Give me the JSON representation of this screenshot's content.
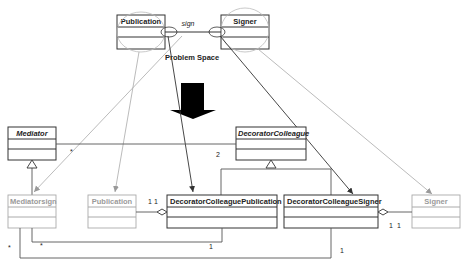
{
  "diagram": {
    "type": "uml-class-diagram",
    "problem_space": {
      "label": "Problem Space",
      "association_label": "sign",
      "classes": [
        {
          "id": "publication_top",
          "name": "Publication"
        },
        {
          "id": "signer_top",
          "name": "Signer"
        }
      ]
    },
    "solution_space": {
      "classes": [
        {
          "id": "mediator",
          "name": "Mediator",
          "abstract": true
        },
        {
          "id": "decorator_colleague",
          "name": "DecoratorColleague",
          "abstract": true
        },
        {
          "id": "mediatorsign",
          "name": "Mediatorsign",
          "faded": true
        },
        {
          "id": "publication_bottom",
          "name": "Publication",
          "faded": true
        },
        {
          "id": "dc_publication",
          "name": "DecoratorColleaguePublication"
        },
        {
          "id": "dc_signer",
          "name": "DecoratorColleagueSigner"
        },
        {
          "id": "signer_bottom",
          "name": "Signer",
          "faded": true
        }
      ],
      "multiplicities": {
        "mediator_assoc_star": "*",
        "mediator_assoc_two": "2",
        "pub_agg_left": "1",
        "pub_agg_right": "1",
        "signer_agg_left": "1",
        "signer_agg_right": "1",
        "inner_loop_star": "*",
        "inner_loop_one": "1",
        "outer_loop_star": "*",
        "outer_loop_one": "1"
      }
    },
    "transform_arrow": "down-arrow",
    "colors": {
      "line_dark": "#333333",
      "line_faded": "#aaaaaa",
      "ellipse": "#bbbbbb",
      "arrow_fill": "#000000"
    }
  }
}
